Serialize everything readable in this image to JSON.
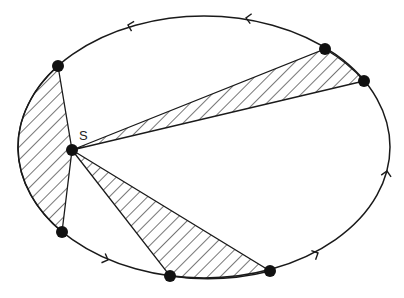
{
  "diagram": {
    "colors": {
      "stroke": "#1a1a1a",
      "background": "#ffffff"
    },
    "orbit": {
      "cx": 204,
      "cy": 147,
      "rx": 186,
      "ry": 131,
      "direction": "counterclockwise"
    },
    "focus": {
      "label": "S",
      "x": 72,
      "y": 150
    },
    "points": [
      {
        "id": "P1",
        "x": 58,
        "y": 66
      },
      {
        "id": "P2",
        "x": 62,
        "y": 232
      },
      {
        "id": "P3",
        "x": 170,
        "y": 276
      },
      {
        "id": "P4",
        "x": 270,
        "y": 271
      },
      {
        "id": "P5",
        "x": 364,
        "y": 81
      },
      {
        "id": "P6",
        "x": 325,
        "y": 49
      }
    ],
    "swept_areas": [
      {
        "name": "near-perihelion",
        "from": "P2",
        "to": "P1"
      },
      {
        "name": "bottom",
        "from": "P3",
        "to": "P4"
      },
      {
        "name": "near-aphelion",
        "from": "P5",
        "to": "P6"
      }
    ],
    "arrows": [
      {
        "name": "arrow-top",
        "x": 128,
        "y": 25,
        "angle": 200
      },
      {
        "name": "arrow-bottom-left",
        "x": 105,
        "y": 259,
        "angle": 22
      },
      {
        "name": "arrow-bottom-right",
        "x": 318,
        "y": 253,
        "angle": -25
      },
      {
        "name": "arrow-right",
        "x": 387,
        "y": 171,
        "angle": -80
      }
    ]
  }
}
